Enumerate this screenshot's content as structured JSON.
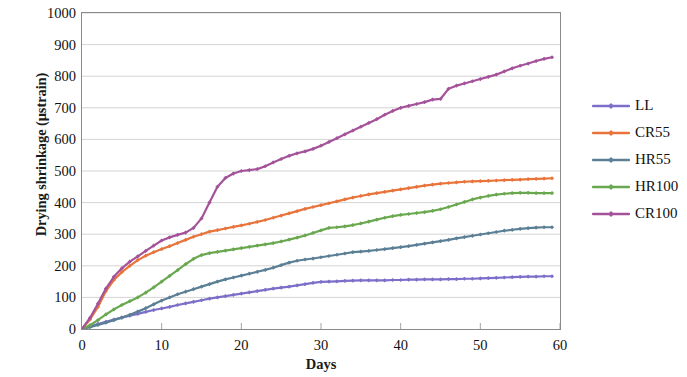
{
  "chart_data": {
    "type": "line",
    "title": "",
    "xlabel": "Days",
    "ylabel": "Drying shrinkage (μstrain)",
    "xlim": [
      0,
      60
    ],
    "ylim": [
      0,
      1000
    ],
    "xticks": [
      0,
      10,
      20,
      30,
      40,
      50,
      60
    ],
    "yticks": [
      0,
      100,
      200,
      300,
      400,
      500,
      600,
      700,
      800,
      900,
      1000
    ],
    "grid": "horizontal",
    "legend_position": "right",
    "marker": "small-diamond",
    "x": [
      0,
      1,
      2,
      3,
      4,
      5,
      6,
      7,
      8,
      9,
      10,
      11,
      12,
      13,
      14,
      15,
      16,
      17,
      18,
      19,
      20,
      21,
      22,
      23,
      24,
      25,
      26,
      27,
      28,
      29,
      30,
      31,
      32,
      33,
      34,
      35,
      36,
      37,
      38,
      39,
      40,
      41,
      42,
      43,
      44,
      45,
      46,
      47,
      48,
      49,
      50,
      51,
      52,
      53,
      54,
      55,
      56,
      57,
      58,
      59
    ],
    "series": [
      {
        "name": "LL",
        "color": "#7b6fc9",
        "values": [
          0,
          8,
          16,
          23,
          30,
          36,
          42,
          48,
          54,
          60,
          65,
          70,
          76,
          81,
          86,
          91,
          96,
          100,
          104,
          108,
          112,
          116,
          120,
          124,
          128,
          131,
          134,
          138,
          142,
          146,
          149,
          150,
          151,
          152,
          153,
          154,
          154,
          154,
          154,
          155,
          155,
          156,
          156,
          157,
          157,
          157,
          158,
          158,
          159,
          159,
          160,
          161,
          162,
          163,
          164,
          165,
          166,
          166,
          167,
          167
        ]
      },
      {
        "name": "CR55",
        "color": "#e8743b",
        "values": [
          0,
          30,
          70,
          120,
          155,
          180,
          200,
          218,
          232,
          243,
          253,
          262,
          272,
          282,
          292,
          300,
          308,
          313,
          318,
          323,
          328,
          333,
          339,
          345,
          352,
          359,
          366,
          373,
          380,
          386,
          392,
          398,
          404,
          410,
          416,
          421,
          426,
          430,
          434,
          438,
          442,
          446,
          450,
          454,
          457,
          460,
          462,
          464,
          466,
          467,
          468,
          469,
          470,
          471,
          472,
          473,
          474,
          475,
          476,
          477
        ]
      },
      {
        "name": "HR55",
        "color": "#5b7f95",
        "values": [
          0,
          6,
          13,
          20,
          28,
          36,
          45,
          55,
          66,
          78,
          90,
          100,
          110,
          118,
          126,
          134,
          142,
          150,
          157,
          163,
          169,
          175,
          181,
          187,
          194,
          202,
          210,
          216,
          220,
          223,
          227,
          231,
          235,
          239,
          243,
          245,
          247,
          250,
          253,
          256,
          259,
          262,
          266,
          270,
          274,
          278,
          282,
          287,
          291,
          295,
          299,
          303,
          307,
          311,
          314,
          317,
          319,
          321,
          322,
          322
        ]
      },
      {
        "name": "HR100",
        "color": "#6aa84f",
        "values": [
          0,
          12,
          28,
          46,
          62,
          76,
          88,
          100,
          115,
          132,
          150,
          168,
          186,
          205,
          222,
          234,
          240,
          244,
          248,
          252,
          256,
          260,
          264,
          268,
          272,
          277,
          283,
          289,
          296,
          304,
          312,
          320,
          322,
          325,
          329,
          334,
          340,
          346,
          352,
          357,
          361,
          364,
          367,
          370,
          374,
          379,
          386,
          394,
          402,
          410,
          416,
          421,
          425,
          428,
          430,
          431,
          431,
          430,
          430,
          430
        ]
      },
      {
        "name": "CR100",
        "color": "#a4539a",
        "values": [
          0,
          35,
          80,
          128,
          165,
          192,
          213,
          230,
          247,
          264,
          280,
          290,
          298,
          305,
          320,
          350,
          400,
          450,
          478,
          492,
          500,
          503,
          506,
          515,
          527,
          538,
          548,
          556,
          562,
          570,
          580,
          592,
          604,
          616,
          628,
          640,
          652,
          664,
          678,
          690,
          700,
          706,
          712,
          718,
          726,
          728,
          760,
          770,
          777,
          784,
          791,
          798,
          805,
          815,
          825,
          833,
          840,
          848,
          855,
          860
        ]
      }
    ]
  },
  "axes": {
    "ytick_labels": [
      "1000",
      "900",
      "800",
      "700",
      "600",
      "500",
      "400",
      "300",
      "200",
      "100",
      "0"
    ],
    "xtick_labels": [
      "0",
      "10",
      "20",
      "30",
      "40",
      "50",
      "60"
    ],
    "x_title": "Days",
    "y_title": "Drying shrinkage (μstrain)"
  },
  "legend": {
    "items": [
      {
        "label": "LL",
        "color": "#7b6fc9"
      },
      {
        "label": "CR55",
        "color": "#e8743b"
      },
      {
        "label": "HR55",
        "color": "#5b7f95"
      },
      {
        "label": "HR100",
        "color": "#6aa84f"
      },
      {
        "label": "CR100",
        "color": "#a4539a"
      }
    ]
  },
  "style": {
    "grid_color": "#cfcfcf",
    "frame_color": "#8a8a8a",
    "background": "#ffffff",
    "text_color": "#111111"
  }
}
